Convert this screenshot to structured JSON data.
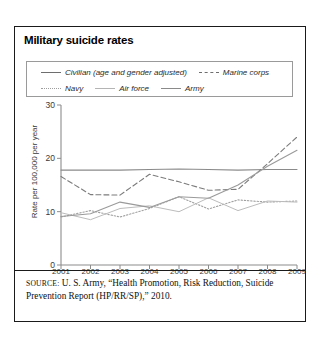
{
  "figure": {
    "title": "Military suicide rates",
    "source_prefix": "SOURCE:",
    "source_text": " U. S. Army, “Health Promotion, Risk Reduction, Suicide Prevention Report (HP/RR/SP),” 2010."
  },
  "chart_data": {
    "type": "line",
    "title": "Military suicide rates",
    "xlabel": "",
    "ylabel": "Rate per 100,000 per year",
    "x": [
      2001,
      2002,
      2003,
      2004,
      2005,
      2006,
      2007,
      2008,
      2009
    ],
    "xtick_labels": [
      "2001",
      "2002",
      "2003",
      "2004",
      "2005",
      "2006",
      "2007",
      "2008",
      "2009"
    ],
    "ytick_labels": [
      "0",
      "10",
      "20",
      "30"
    ],
    "yticks": [
      0,
      10,
      20,
      30
    ],
    "ylim": [
      0,
      30
    ],
    "xlim": [
      2001,
      2009
    ],
    "grid": false,
    "legend_position": "above-plot",
    "series": [
      {
        "name": "Civilian (age and gender adjusted)",
        "style": "solid",
        "color": "#8a8a8a",
        "values": [
          17.8,
          17.8,
          17.8,
          17.9,
          18.0,
          17.9,
          17.8,
          17.9,
          17.9
        ]
      },
      {
        "name": "Marine corps",
        "style": "dashed",
        "color": "#7b7b7b",
        "values": [
          16.6,
          13.2,
          13.1,
          17.0,
          15.6,
          14.0,
          14.2,
          19.0,
          24.0
        ]
      },
      {
        "name": "Navy",
        "style": "dotted",
        "color": "#a0a0a0",
        "values": [
          9.0,
          10.2,
          9.0,
          10.6,
          12.8,
          10.5,
          12.2,
          11.8,
          12.0
        ]
      },
      {
        "name": "Air force",
        "style": "solid-light",
        "color": "#bcbcbc",
        "values": [
          9.8,
          8.5,
          10.6,
          11.1,
          10.0,
          12.6,
          10.2,
          12.0,
          11.8
        ]
      },
      {
        "name": "Army",
        "style": "solid",
        "color": "#9a9a9a",
        "values": [
          9.1,
          9.6,
          11.8,
          10.8,
          12.8,
          12.5,
          15.0,
          18.5,
          21.5
        ]
      }
    ]
  },
  "legend": {
    "row1": [
      {
        "label": "Civilian (age and gender adjusted)",
        "style": "solid"
      },
      {
        "label": "Marine corps",
        "style": "dash"
      }
    ],
    "row2": [
      {
        "label": "Navy",
        "style": "dot"
      },
      {
        "label": "Air force",
        "style": "solid-l"
      },
      {
        "label": "Army",
        "style": "solid-m"
      }
    ]
  }
}
